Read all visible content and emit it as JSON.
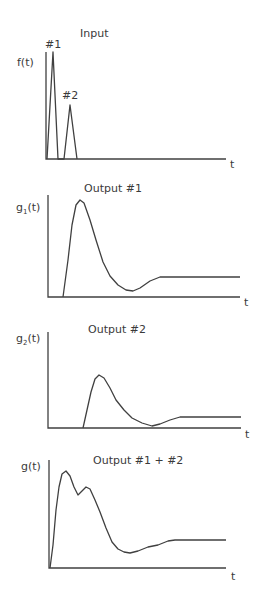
{
  "chart_data": [
    {
      "type": "line",
      "id": "input",
      "title": "Input",
      "ylabel": "f(t)",
      "xlabel": "t",
      "annotations": [
        "#1",
        "#2"
      ],
      "grid": false,
      "description": "Two narrow triangular pulses; pulse #1 taller and earlier, pulse #2 about half height and slightly later",
      "points": [
        [
          47,
          159
        ],
        [
          53,
          52
        ],
        [
          58,
          159
        ],
        [
          64,
          159
        ],
        [
          70,
          105
        ],
        [
          77,
          159
        ]
      ],
      "axis": {
        "x0": 46,
        "y0": 159,
        "ytop": 52,
        "xend": 226
      },
      "title_pos": [
        97,
        33
      ],
      "ylabel_pos": [
        18,
        65
      ],
      "xlabel_pos": [
        230,
        166
      ],
      "annotation_pos": [
        [
          45,
          46
        ],
        [
          62,
          97
        ]
      ]
    },
    {
      "type": "line",
      "id": "output1",
      "title": "Output #1",
      "ylabel": "g1(t)",
      "xlabel": "t",
      "grid": false,
      "description": "Response to pulse #1: rises to a peak, undershoots, then settles to a steady level",
      "points": [
        [
          63,
          297
        ],
        [
          68,
          260
        ],
        [
          72,
          225
        ],
        [
          76,
          205
        ],
        [
          80,
          200
        ],
        [
          84,
          203
        ],
        [
          90,
          220
        ],
        [
          96,
          240
        ],
        [
          103,
          262
        ],
        [
          110,
          276
        ],
        [
          118,
          285
        ],
        [
          126,
          290
        ],
        [
          133,
          291
        ],
        [
          140,
          288
        ],
        [
          150,
          281
        ],
        [
          160,
          277
        ],
        [
          240,
          277
        ]
      ],
      "axis": {
        "x0": 48,
        "y0": 297,
        "ytop": 195,
        "xend": 240
      },
      "title_pos": [
        84,
        189
      ],
      "ylabel_pos": [
        16,
        209
      ],
      "xlabel_pos": [
        244,
        304
      ]
    },
    {
      "type": "line",
      "id": "output2",
      "title": "Output #2",
      "ylabel": "g2(t)",
      "xlabel": "t",
      "grid": false,
      "description": "Response to pulse #2: smaller delayed version of output #1",
      "points": [
        [
          83,
          428
        ],
        [
          87,
          410
        ],
        [
          91,
          392
        ],
        [
          95,
          379
        ],
        [
          99,
          375
        ],
        [
          104,
          378
        ],
        [
          110,
          388
        ],
        [
          116,
          400
        ],
        [
          124,
          410
        ],
        [
          132,
          418
        ],
        [
          142,
          423
        ],
        [
          152,
          426
        ],
        [
          160,
          424
        ],
        [
          170,
          420
        ],
        [
          180,
          417
        ],
        [
          241,
          417
        ]
      ],
      "axis": {
        "x0": 48,
        "y0": 428,
        "ytop": 332,
        "xend": 241
      },
      "title_pos": [
        88,
        330
      ],
      "ylabel_pos": [
        16,
        340
      ],
      "xlabel_pos": [
        245,
        436
      ]
    },
    {
      "type": "line",
      "id": "combined",
      "title": "Output #1 + #2",
      "ylabel": "g(t)",
      "xlabel": "t",
      "grid": false,
      "description": "Sum of outputs: primary peak, small dip, secondary hump, undershoot, then settles",
      "points": [
        [
          50,
          568
        ],
        [
          53,
          545
        ],
        [
          56,
          510
        ],
        [
          59,
          487
        ],
        [
          62,
          474
        ],
        [
          66,
          471
        ],
        [
          70,
          476
        ],
        [
          74,
          487
        ],
        [
          78,
          495
        ],
        [
          82,
          491
        ],
        [
          86,
          487
        ],
        [
          90,
          489
        ],
        [
          95,
          500
        ],
        [
          100,
          512
        ],
        [
          106,
          528
        ],
        [
          112,
          542
        ],
        [
          118,
          549
        ],
        [
          124,
          552
        ],
        [
          130,
          553
        ],
        [
          138,
          551
        ],
        [
          148,
          547
        ],
        [
          158,
          545
        ],
        [
          168,
          541
        ],
        [
          175,
          540
        ],
        [
          226,
          540
        ]
      ],
      "axis": {
        "x0": 49,
        "y0": 568,
        "ytop": 460,
        "xend": 226
      },
      "title_pos": [
        93,
        461
      ],
      "ylabel_pos": [
        22,
        467
      ],
      "xlabel_pos": [
        231,
        578
      ]
    }
  ]
}
